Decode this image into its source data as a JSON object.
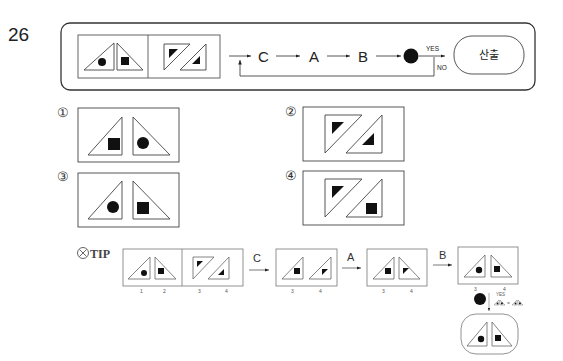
{
  "problem": {
    "number": "26",
    "flow": {
      "steps": [
        "C",
        "A",
        "B"
      ],
      "decision_yes": "YES",
      "decision_no": "NO",
      "output_label": "산출"
    }
  },
  "options": [
    {
      "label": "①"
    },
    {
      "label": "②"
    },
    {
      "label": "③"
    },
    {
      "label": "④"
    }
  ],
  "tip": {
    "label": "TIP",
    "icon": "cross-circle-icon",
    "indices_initial": [
      "1",
      "2",
      "3",
      "4"
    ],
    "step_labels": [
      "C",
      "A",
      "B"
    ],
    "indices_after_c": [
      "3",
      "4"
    ],
    "indices_after_a": [
      "3",
      "4"
    ],
    "indices_after_b": [
      "3",
      "4"
    ],
    "yes_label": "YES"
  }
}
